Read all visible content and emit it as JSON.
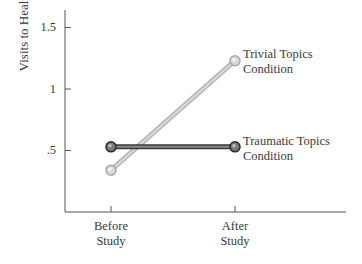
{
  "chart_data": {
    "type": "line",
    "title": "",
    "xlabel": "",
    "ylabel": "Visits to Health Center",
    "categories": [
      "Before Study",
      "After Study"
    ],
    "category_lines": [
      [
        "Before",
        "Study"
      ],
      [
        "After",
        "Study"
      ]
    ],
    "yticks": [
      {
        "value": 0.5,
        "label": ".5"
      },
      {
        "value": 1.0,
        "label": "1"
      },
      {
        "value": 1.5,
        "label": "1.5"
      }
    ],
    "ylim": [
      0,
      1.65
    ],
    "grid": false,
    "legend_position": "inline-right",
    "series": [
      {
        "name": "Trivial Topics Condition",
        "label_lines": [
          "Trivial Topics",
          "Condition"
        ],
        "values": [
          0.34,
          1.23
        ],
        "color": "#c8c8c8",
        "marker_color": "#d6d6d6"
      },
      {
        "name": "Traumatic Topics Condition",
        "label_lines": [
          "Traumatic Topics",
          "Condition"
        ],
        "values": [
          0.53,
          0.53
        ],
        "color": "#5a5a5a",
        "marker_color": "#6a6a6a"
      }
    ]
  }
}
